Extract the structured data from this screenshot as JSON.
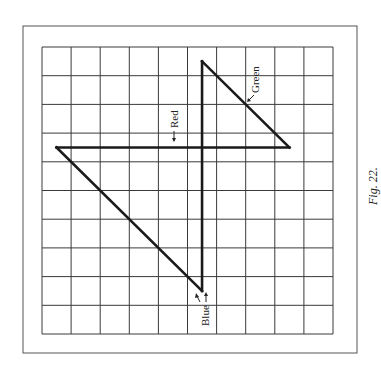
{
  "figure": {
    "caption": "Fig. 22.",
    "grid": {
      "columns": 10,
      "rows": 10
    },
    "frame": {
      "outer": [
        23,
        26,
        357,
        353
      ],
      "grid": [
        42,
        47,
        333,
        334
      ]
    },
    "colors": {
      "line": "#1a1a1a",
      "grid": "#3a3a3a",
      "frame": "#555555",
      "background": "#ffffff"
    }
  },
  "traces": [
    {
      "name": "Red",
      "label": "Red",
      "from": [
        0.5,
        3.5
      ],
      "to": [
        8.5,
        3.5
      ]
    },
    {
      "name": "Green",
      "label": "Green",
      "from": [
        5.5,
        0.5
      ],
      "to": [
        8.5,
        3.5
      ]
    },
    {
      "name": "Blue",
      "label": "Blue",
      "from": [
        0.5,
        3.5
      ],
      "to": [
        5.5,
        8.5
      ]
    },
    {
      "name": "Vertical",
      "from": [
        5.5,
        0.5
      ],
      "to": [
        5.5,
        8.5
      ]
    }
  ],
  "labels": {
    "red": "Red",
    "green": "Green",
    "blue": "Blue"
  }
}
